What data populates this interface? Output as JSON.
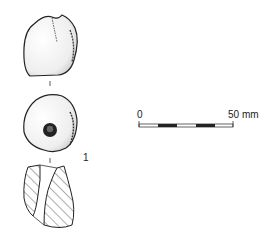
{
  "figure": {
    "object_number": "1",
    "views": [
      "exterior-view",
      "perforation-view",
      "section-view"
    ]
  },
  "scale_bar": {
    "start_label": "0",
    "end_label": "50 mm",
    "segments": 5
  },
  "colors": {
    "ink": "#222222",
    "background": "#ffffff"
  }
}
